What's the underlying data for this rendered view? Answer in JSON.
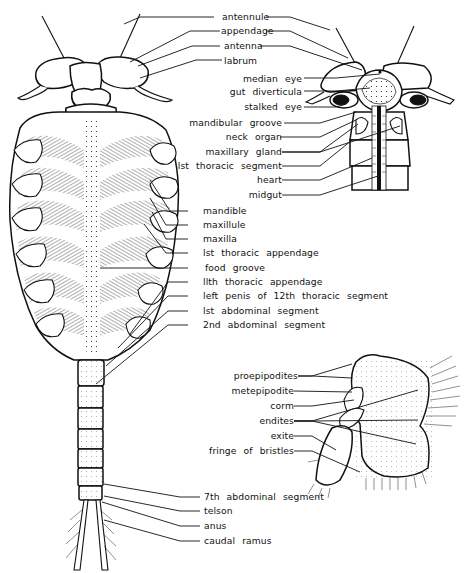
{
  "figure": {
    "panels": [
      {
        "id": "whole-body-ventral",
        "labels": [
          "antennule",
          "appendage",
          "antenna",
          "labrum",
          "mandible",
          "maxillule",
          "maxilla",
          "lst thoracic appendage",
          "food groove",
          "llth thoracic appendage",
          "left penis of 12th thoracic segment",
          "lst abdominal segment",
          "2nd abdominal segment",
          "7th abdominal segment",
          "telson",
          "anus",
          "caudal ramus"
        ]
      },
      {
        "id": "head-dorsal",
        "labels": [
          "median eye",
          "gut diverticula",
          "stalked eye",
          "mandibular groove",
          "neck organ",
          "maxillary gland",
          "lst thoracic segment",
          "heart",
          "midgut"
        ]
      },
      {
        "id": "thoracic-appendage",
        "labels": [
          "proepipodites",
          "metepipodite",
          "corm",
          "endites",
          "exite",
          "fringe of bristles"
        ]
      }
    ]
  },
  "labels": {
    "antennule": "antennule",
    "appendage": "appendage",
    "antenna": "antenna",
    "labrum": "labrum",
    "median_eye": "median eye",
    "gut_diverticula": "gut diverticula",
    "stalked_eye": "stalked eye",
    "mandibular_groove": "mandibular groove",
    "neck_organ": "neck organ",
    "maxillary_gland": "maxillary gland",
    "first_thoracic_segment": "lst thoracic segment",
    "heart": "heart",
    "midgut": "midgut",
    "mandible": "mandible",
    "maxillule": "maxillule",
    "maxilla": "maxilla",
    "first_thoracic_appendage": "lst thoracic appendage",
    "food_groove": "food groove",
    "eleventh_thoracic_appendage": "llth thoracic appendage",
    "left_penis": "left penis of 12th thoracic segment",
    "first_abdominal_segment": "lst abdominal segment",
    "second_abdominal_segment": "2nd abdominal segment",
    "proepipodites": "proepipodites",
    "metepipodite": "metepipodite",
    "corm": "corm",
    "endites": "endites",
    "exite": "exite",
    "fringe_of_bristles": "fringe of bristles",
    "seventh_abdominal_segment": "7th abdominal segment",
    "telson": "telson",
    "anus": "anus",
    "caudal_ramus": "caudal ramus"
  }
}
